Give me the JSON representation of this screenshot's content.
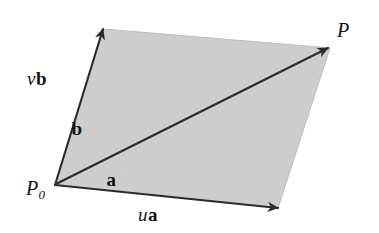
{
  "figure": {
    "background_color": "#ffffff",
    "fill_color": "#cfcfcf",
    "stroke_color": "#2b2b2b",
    "width": 379,
    "height": 233
  },
  "labels": {
    "point_origin": {
      "base": "P",
      "subscript": "0",
      "x": 26,
      "y": 178
    },
    "point_target": {
      "base": "P",
      "subscript": "",
      "x": 337,
      "y": 20
    },
    "vb": {
      "scalar": "v",
      "vector": "b",
      "x": 27,
      "y": 69
    },
    "b": {
      "scalar": "",
      "vector": "b",
      "x": 71,
      "y": 119
    },
    "a": {
      "scalar": "",
      "vector": "a",
      "x": 106,
      "y": 170
    },
    "ua": {
      "scalar": "u",
      "vector": "a",
      "x": 138,
      "y": 205
    }
  },
  "geometry": {
    "vertices": {
      "p0": [
        55,
        185
      ],
      "top_left": [
        103,
        29
      ],
      "top_right": [
        330,
        48
      ],
      "bottom_right": [
        278,
        208
      ]
    },
    "parallelogram_path": "M 55,185 L 103,29 L 330,48 L 278,208 Z",
    "edge_vb": {
      "from": [
        55,
        185
      ],
      "to": [
        103,
        29
      ],
      "mid_arrow_at": [
        83,
        90
      ]
    },
    "edge_ua": {
      "from": [
        55,
        185
      ],
      "to": [
        278,
        208
      ],
      "mid_arrow_at": [
        150,
        195
      ]
    },
    "diagonal": {
      "from": [
        55,
        185
      ],
      "to": [
        328,
        48
      ]
    }
  }
}
